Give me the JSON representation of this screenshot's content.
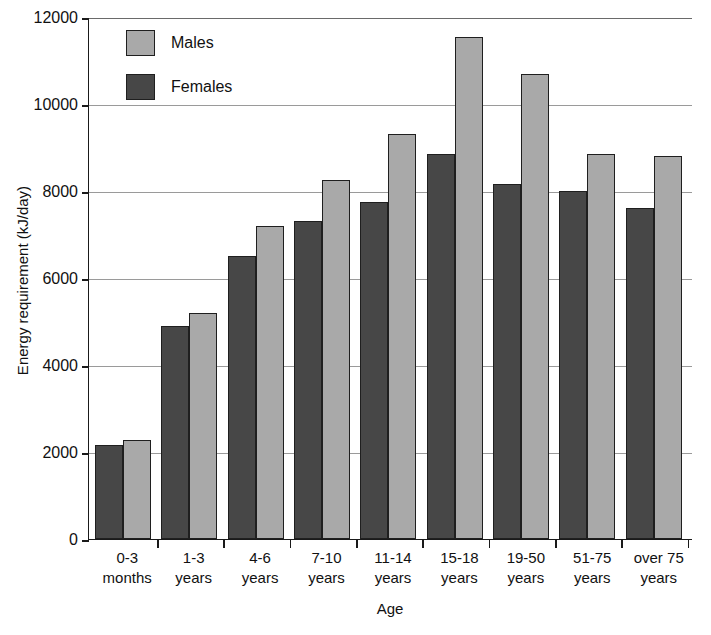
{
  "chart_data": {
    "type": "bar",
    "title": "",
    "xlabel": "Age",
    "ylabel": "Energy requirement (kJ/day)",
    "ylim": [
      0,
      12000
    ],
    "ytick_step": 2000,
    "yticks": [
      "12000",
      "10000",
      "8000",
      "6000",
      "4000",
      "2000",
      "0"
    ],
    "grid": true,
    "legend_position": "top-left",
    "categories": [
      "0-3 months",
      "1-3 years",
      "4-6 years",
      "7-10 years",
      "11-14 years",
      "15-18 years",
      "19-50 years",
      "51-75 years",
      "over 75 years"
    ],
    "category_lines": [
      {
        "line1": "0-3",
        "line2": "months"
      },
      {
        "line1": "1-3",
        "line2": "years"
      },
      {
        "line1": "4-6",
        "line2": "years"
      },
      {
        "line1": "7-10",
        "line2": "years"
      },
      {
        "line1": "11-14",
        "line2": "years"
      },
      {
        "line1": "15-18",
        "line2": "years"
      },
      {
        "line1": "19-50",
        "line2": "years"
      },
      {
        "line1": "51-75",
        "line2": "years"
      },
      {
        "line1": "over 75",
        "line2": "years"
      }
    ],
    "series": [
      {
        "name": "Females",
        "color": "#474747",
        "values": [
          2150,
          4900,
          6500,
          7300,
          7750,
          8850,
          8150,
          8000,
          7600
        ]
      },
      {
        "name": "Males",
        "color": "#a9a9a9",
        "values": [
          2270,
          5200,
          7200,
          8250,
          9300,
          11550,
          10700,
          8850,
          8800
        ]
      }
    ],
    "series_order_in_group": [
      "Females",
      "Males"
    ]
  },
  "legend": {
    "items": [
      {
        "label": "Males",
        "color": "#a9a9a9"
      },
      {
        "label": "Females",
        "color": "#474747"
      }
    ]
  },
  "axes": {
    "y_title": "Energy requirement (kJ/day)",
    "x_title": "Age"
  }
}
